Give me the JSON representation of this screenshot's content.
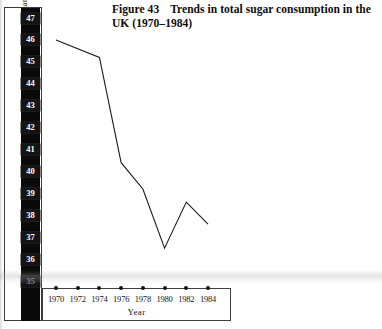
{
  "figure": {
    "label": "Figure 43",
    "title": "Trends in total sugar consumption in the UK (1970–1984)"
  },
  "axes": {
    "y_caption": "Sugar (sucrose) consumption* Kg/person/year",
    "x_caption": "Year"
  },
  "chart_data": {
    "type": "line",
    "xlabel": "Year",
    "ylabel": "Sugar (sucrose) consumption* Kg/person/year",
    "xlim": [
      1970,
      1984
    ],
    "ylim": [
      35,
      47
    ],
    "grid": false,
    "legend": null,
    "xticks": [
      1970,
      1972,
      1974,
      1976,
      1978,
      1980,
      1982,
      1984
    ],
    "xtick_labels": [
      "1970",
      "1972",
      "1974",
      "1976",
      "1978",
      "1980",
      "1982",
      "1984"
    ],
    "yticks": [
      47,
      46,
      45,
      44,
      43,
      42,
      41,
      40,
      39,
      38,
      37,
      36,
      35
    ],
    "ytick_labels": [
      "47",
      "46",
      "45",
      "44",
      "43",
      "42",
      "41",
      "40",
      "39",
      "38",
      "37",
      "36",
      "35"
    ],
    "x": [
      1970,
      1974,
      1976,
      1978,
      1980,
      1982,
      1984
    ],
    "values": [
      46.0,
      45.2,
      40.4,
      39.2,
      36.5,
      38.6,
      37.6
    ],
    "series": [
      {
        "name": "Total sugar consumption",
        "x": [
          1970,
          1974,
          1976,
          1978,
          1980,
          1982,
          1984
        ],
        "values": [
          46.0,
          45.2,
          40.4,
          39.2,
          36.5,
          38.6,
          37.6
        ],
        "color": "#1a1a1a",
        "marker": "none",
        "linewidth": 1.1
      }
    ]
  },
  "style": {
    "line_color": "#1a1a1a",
    "strip_background": "#0a0a0a",
    "strip_text": "#ffffff",
    "frame_color": "#3a3a3a",
    "paper": "#ffffff"
  }
}
